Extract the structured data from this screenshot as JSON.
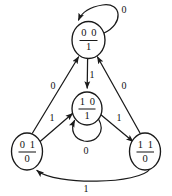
{
  "diagram": {
    "type": "state-transition-diagram",
    "title": "",
    "background_color": "#ffffff",
    "stroke_color": "#1a1a1a",
    "text_color": "#111111",
    "width": 172,
    "height": 196,
    "notation": "state label shown as present-state bits over output bit, separated by a horizontal fraction bar",
    "states": [
      {
        "id": "s00",
        "name": "state-00",
        "bits": "0 0",
        "output": "1",
        "position": "top",
        "cx": 88.5,
        "cy": 40.0,
        "rx": 16.5,
        "ry": 18.5
      },
      {
        "id": "s10",
        "name": "state-10",
        "bits": "1 0",
        "output": "1",
        "position": "middle",
        "cx": 87.0,
        "cy": 108.5,
        "rx": 15.0,
        "ry": 16.5
      },
      {
        "id": "s01",
        "name": "state-01",
        "bits": "0 1",
        "output": "0",
        "position": "bottom-left",
        "cx": 27.0,
        "cy": 151.5,
        "rx": 15.5,
        "ry": 18.5
      },
      {
        "id": "s11",
        "name": "state-11",
        "bits": "1 1",
        "output": "0",
        "position": "bottom-right",
        "cx": 145.0,
        "cy": 151.5,
        "rx": 15.5,
        "ry": 18.5
      }
    ],
    "transitions": [
      {
        "id": "t-00-00",
        "name": "transition-00-to-00",
        "from": "s00",
        "to": "s00",
        "label": "0",
        "kind": "self-loop",
        "label_x": 124.0,
        "label_y": 11.0
      },
      {
        "id": "t-00-10",
        "name": "transition-00-to-10",
        "from": "s00",
        "to": "s10",
        "label": "1",
        "kind": "straight-vertical",
        "label_x": 92.0,
        "label_y": 76.0
      },
      {
        "id": "t-01-00",
        "name": "transition-01-to-00",
        "from": "s01",
        "to": "s00",
        "label": "0",
        "kind": "diagonal",
        "label_x": 53.0,
        "label_y": 87.0
      },
      {
        "id": "t-01-10",
        "name": "transition-01-to-10",
        "from": "s01",
        "to": "s10",
        "label": "1",
        "kind": "diagonal",
        "label_x": 52.0,
        "label_y": 119.0
      },
      {
        "id": "t-10-10",
        "name": "transition-10-to-10",
        "from": "s10",
        "to": "s10",
        "label": "0",
        "kind": "self-loop",
        "label_x": 86.0,
        "label_y": 152.0
      },
      {
        "id": "t-10-11",
        "name": "transition-10-to-11",
        "from": "s10",
        "to": "s11",
        "label": "1",
        "kind": "diagonal",
        "label_x": 119.0,
        "label_y": 119.0
      },
      {
        "id": "t-11-00",
        "name": "transition-11-to-00",
        "from": "s11",
        "to": "s00",
        "label": "0",
        "kind": "diagonal",
        "label_x": 124.0,
        "label_y": 87.0
      },
      {
        "id": "t-11-01",
        "name": "transition-11-to-01",
        "from": "s11",
        "to": "s01",
        "label": "1",
        "kind": "curved-bottom",
        "label_x": 86.0,
        "label_y": 190.0
      }
    ]
  }
}
